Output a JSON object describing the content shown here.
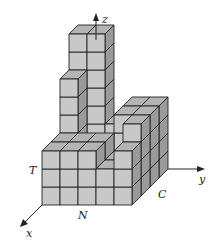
{
  "figure": {
    "axes": {
      "x": "x",
      "y": "y",
      "z": "z"
    },
    "point_labels": {
      "T": "T",
      "N": "N",
      "C": "C"
    },
    "colors": {
      "front_face": "#c8c8c8",
      "top_face": "#b4b4b4",
      "side_face": "#9a9a9a",
      "edge": "#222222",
      "axis": "#222222"
    },
    "grid": {
      "columns_x_direction": 5,
      "rows_depth_direction": 4,
      "cube_px": 18,
      "depth_dx": 9,
      "depth_dy": 9
    },
    "heightmap": [
      [
        3,
        3,
        6,
        8
      ],
      [
        3,
        3,
        2,
        8
      ],
      [
        3,
        3,
        2,
        3
      ],
      [
        2,
        2,
        4,
        4
      ],
      [
        3,
        4,
        4,
        4
      ]
    ]
  }
}
